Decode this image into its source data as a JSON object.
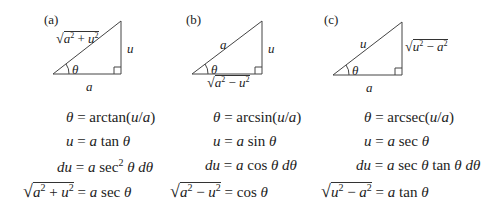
{
  "panels": [
    {
      "label": "(a)",
      "hypotenuse": "√(a² + u²)",
      "vertical_side": "u",
      "horizontal_side": "a",
      "angle": "θ",
      "equations": [
        {
          "lhs": "θ",
          "rhs": "arctan(u/a)"
        },
        {
          "lhs": "u",
          "rhs": "a tan θ"
        },
        {
          "lhs": "du",
          "rhs": "a sec² θ dθ"
        },
        {
          "lhs": "√(a² + u²)",
          "rhs": "a sec θ"
        }
      ]
    },
    {
      "label": "(b)",
      "hypotenuse": "a",
      "vertical_side": "u",
      "horizontal_side": "√(a² − u²)",
      "angle": "θ",
      "equations": [
        {
          "lhs": "θ",
          "rhs": "arcsin(u/a)"
        },
        {
          "lhs": "u",
          "rhs": "a sin θ"
        },
        {
          "lhs": "du",
          "rhs": "a cos θ dθ"
        },
        {
          "lhs": "√(a² − u²)",
          "rhs": "cos θ"
        }
      ]
    },
    {
      "label": "(c)",
      "hypotenuse": "u",
      "vertical_side": "√(u² − a²)",
      "horizontal_side": "a",
      "angle": "θ",
      "equations": [
        {
          "lhs": "θ",
          "rhs": "arcsec(u/a)"
        },
        {
          "lhs": "u",
          "rhs": "a sec θ"
        },
        {
          "lhs": "du",
          "rhs": "a sec θ tan θ dθ"
        },
        {
          "lhs": "√(u² − a²)",
          "rhs": "a tan θ"
        }
      ]
    }
  ],
  "parts": {
    "sqrt": "√",
    "a": "a",
    "u": "u",
    "theta": "θ",
    "plus": "+",
    "minus": "−",
    "sq": "2",
    "eq": "=",
    "d": "d",
    "arctan": "arctan",
    "arcsin": "arcsin",
    "arcsec": "arcsec",
    "tan": "tan",
    "sin": "sin",
    "sec": "sec",
    "cos": "cos",
    "lp": "(",
    "rp": ")",
    "slash": "/"
  }
}
